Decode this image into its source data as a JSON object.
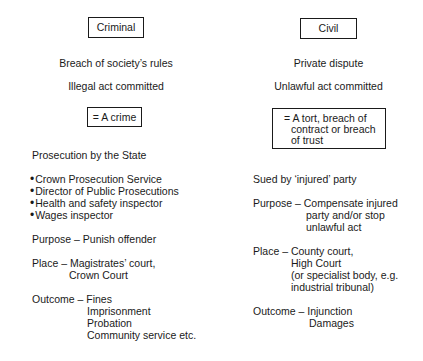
{
  "criminal": {
    "heading": "Criminal",
    "lines": [
      "Breach of society’s rules",
      "Illegal act committed"
    ],
    "result": "= A crime",
    "prosecution": "Prosecution by the State",
    "prosecutors": [
      "Crown Prosecution Service",
      "Director of Public Prosecutions",
      "Health and safety inspector",
      "Wages inspector"
    ],
    "purpose": "Purpose – Punish offender",
    "place_label": "Place – Magistrates’ court,",
    "place_cont": [
      "Crown Court"
    ],
    "outcome_label": "Outcome – Fines",
    "outcome_cont": [
      "Imprisonment",
      "Probation",
      "Community service etc."
    ]
  },
  "civil": {
    "heading": "Civil",
    "lines": [
      "Private dispute",
      "Unlawful act committed"
    ],
    "result": [
      "= A tort, breach of",
      "contract or breach",
      "of trust"
    ],
    "sued_by": "Sued by ‘injured’ party",
    "purpose_label": "Purpose – Compensate injured",
    "purpose_cont": [
      "party and/or stop",
      "unlawful act"
    ],
    "place_label": "Place – County court,",
    "place_cont": [
      "High Court",
      "(or specialist body, e.g.",
      "industrial tribunal)"
    ],
    "outcome_label": "Outcome – Injunction",
    "outcome_cont": [
      "Damages"
    ]
  }
}
